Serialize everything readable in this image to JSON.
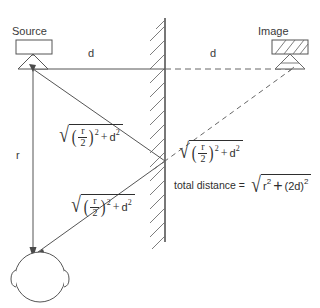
{
  "diagram": {
    "title_labels": {
      "source": "Source",
      "image": "Image"
    },
    "distance_labels": {
      "d_left": "d",
      "d_right": "d",
      "r": "r"
    },
    "expressions": {
      "leg_upper": {
        "radical": "√",
        "numerator": "r",
        "denominator": "2",
        "exponent": "2",
        "plus": "+",
        "second_term": "d",
        "second_exponent": "2",
        "plain": "sqrt((r/2)^2 + d^2)"
      },
      "leg_lower": {
        "radical": "√",
        "numerator": "r",
        "denominator": "2",
        "exponent": "2",
        "plus": "+",
        "second_term": "d",
        "second_exponent": "2",
        "plain": "sqrt((r/2)^2 + d^2)"
      },
      "leg_virtual": {
        "radical": "√",
        "numerator": "r",
        "denominator": "2",
        "exponent": "2",
        "plus": "+",
        "second_term": "d",
        "second_exponent": "2",
        "plain": "sqrt((r/2)^2 + d^2)"
      },
      "total": {
        "label": "total distance =",
        "radical": "√",
        "first_term": "r",
        "first_exponent": "2",
        "plus": "+",
        "second_term": "(2d)",
        "second_exponent": "2",
        "plain": "total distance = sqrt(r^2 + (2d)^2)"
      }
    },
    "icons": {
      "source_lamp": "lamp-icon",
      "image_lamp": "mirrored-lamp-icon",
      "wall": "hatched-wall-icon",
      "listener": "head-icon"
    },
    "colors": {
      "stroke": "#4a4a4a",
      "text": "#3a3a3a",
      "background": "#ffffff",
      "dashed": "#6b6b6b"
    }
  }
}
